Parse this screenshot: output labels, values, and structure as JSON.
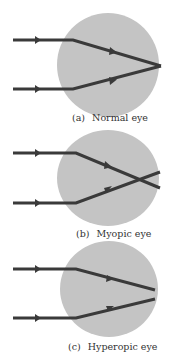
{
  "colors": {
    "eye": "#c4c4c4",
    "ray": "#3a3a3a",
    "text": "#333333"
  },
  "panels": [
    {
      "id": "a",
      "tag": "(a)",
      "label": "Normal eye"
    },
    {
      "id": "b",
      "tag": "(b)",
      "label": "Myopic eye"
    },
    {
      "id": "c",
      "tag": "(c)",
      "label": "Hyperopic eye"
    }
  ]
}
